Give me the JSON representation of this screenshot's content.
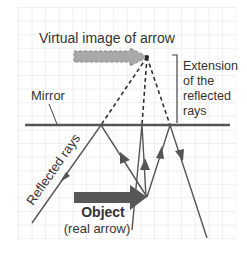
{
  "labels": {
    "virtual_image": "Virtual image of arrow",
    "extension_line1": "Extension",
    "extension_line2": "of the",
    "extension_line3": "reflected",
    "extension_line4": "rays",
    "mirror": "Mirror",
    "reflected_rays": "Reflected rays",
    "object": "Object",
    "object_sub": "(real arrow)"
  },
  "colors": {
    "grid": "#dcdcdc",
    "ray": "#555555",
    "mirror": "#555555",
    "object_arrow": "#575757",
    "virtual_arrow": "#a9a9a9",
    "text": "#333333"
  }
}
